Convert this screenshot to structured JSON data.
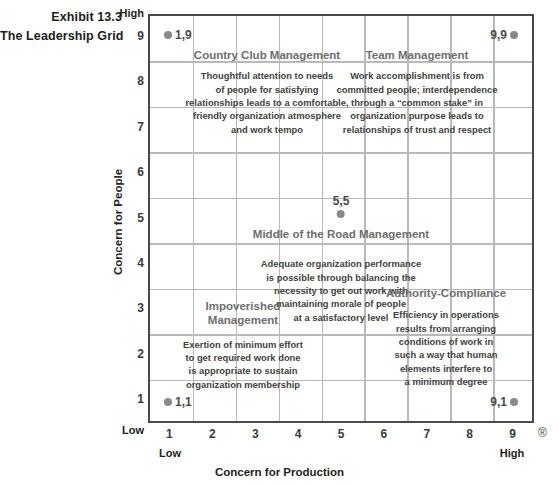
{
  "exhibit": {
    "number_line": "Exhibit 13.3",
    "title_line": "The Leadership Grid"
  },
  "axes": {
    "x": {
      "title": "Concern for Production",
      "low_label": "Low",
      "high_label": "High",
      "ticks": [
        "1",
        "2",
        "3",
        "4",
        "5",
        "6",
        "7",
        "8",
        "9"
      ],
      "registered_mark": "®"
    },
    "y": {
      "title": "Concern for People",
      "low_label": "Low",
      "high_label": "High",
      "ticks": [
        "9",
        "8",
        "7",
        "6",
        "5",
        "4",
        "3",
        "2",
        "1"
      ]
    }
  },
  "styles": {
    "frame_color": "#4a4a4a",
    "grid_color": "#b9b9b9",
    "dot_color": "#8a8a8a",
    "quadrant_title_color": "#6e6e6e",
    "body_text_color": "#3f3f3f"
  },
  "points": [
    {
      "id": "p19",
      "label": "1,9",
      "x": 1,
      "y": 9
    },
    {
      "id": "p99",
      "label": "9,9",
      "x": 9,
      "y": 9
    },
    {
      "id": "p55",
      "label": "5,5",
      "x": 5,
      "y": 5
    },
    {
      "id": "p11",
      "label": "1,1",
      "x": 1,
      "y": 1
    },
    {
      "id": "p91",
      "label": "9,1",
      "x": 9,
      "y": 1
    }
  ],
  "quadrants": {
    "country_club": {
      "title": "Country Club Management",
      "body": [
        "Thoughtful attention to needs",
        "of people for satisfying",
        "relationships leads to a comfortable,",
        "friendly organization atmosphere",
        "and work tempo"
      ]
    },
    "team": {
      "title": "Team Management",
      "body": [
        "Work accomplishment is from",
        "committed people; interdependence",
        "through a “common stake” in",
        "organization purpose leads to",
        "relationships of trust and respect"
      ]
    },
    "middle": {
      "title": "Middle of the Road Management",
      "body": [
        "Adequate organization performance",
        "is possible through balancing the",
        "necessity to get out work with",
        "maintaining morale of people",
        "at a satisfactory level"
      ]
    },
    "impoverished": {
      "title": "Impoverished Management",
      "body": [
        "Exertion of minimum effort",
        "to get required work done",
        "is appropriate to sustain",
        "organization membership"
      ]
    },
    "authority": {
      "title": "Authority-Compliance",
      "body": [
        "Efficiency in operations",
        "results from arranging",
        "conditions of work in",
        "such a way that human",
        "elements interfere to",
        "a minimum degree"
      ]
    }
  },
  "chart_data": {
    "type": "scatter",
    "title": "The Leadership Grid",
    "subtitle": "Exhibit 13.3",
    "xlabel": "Concern for Production",
    "ylabel": "Concern for People",
    "xlim": [
      0,
      9
    ],
    "ylim": [
      0,
      9
    ],
    "xticks": [
      1,
      2,
      3,
      4,
      5,
      6,
      7,
      8,
      9
    ],
    "yticks": [
      1,
      2,
      3,
      4,
      5,
      6,
      7,
      8,
      9
    ],
    "grid": true,
    "legend": "none",
    "points": [
      {
        "x": 1,
        "y": 9,
        "label": "1,9",
        "style": "Country Club Management"
      },
      {
        "x": 9,
        "y": 9,
        "label": "9,9",
        "style": "Team Management"
      },
      {
        "x": 5,
        "y": 5,
        "label": "5,5",
        "style": "Middle of the Road Management"
      },
      {
        "x": 1,
        "y": 1,
        "label": "1,1",
        "style": "Impoverished Management"
      },
      {
        "x": 9,
        "y": 1,
        "label": "9,1",
        "style": "Authority-Compliance"
      }
    ],
    "annotations": [
      "Country Club Management",
      "Team Management",
      "Middle of the Road Management",
      "Impoverished Management",
      "Authority-Compliance"
    ]
  }
}
